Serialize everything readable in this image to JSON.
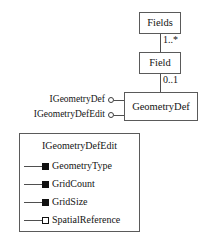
{
  "diagram": {
    "kind": "uml-class-diagram",
    "colors": {
      "background": "#ffffff",
      "box_border": "#5a5a5a",
      "line": "#4f4f4f",
      "text": "#141414",
      "marker_fill": "#111111"
    }
  },
  "classes": {
    "fields": {
      "name": "Fields"
    },
    "field": {
      "name": "Field"
    },
    "geometry_def": {
      "name": "GeometryDef"
    }
  },
  "associations": [
    {
      "from": "Fields",
      "to": "Field",
      "multiplicity": "1..*"
    },
    {
      "from": "Field",
      "to": "GeometryDef",
      "multiplicity": "0..1"
    }
  ],
  "multiplicities": {
    "fields_to_field": "1..*",
    "field_to_geometrydef": "0..1"
  },
  "interfaces": [
    {
      "name": "IGeometryDef"
    },
    {
      "name": "IGeometryDefEdit"
    }
  ],
  "interface_panel": {
    "title": "IGeometryDefEdit",
    "members": [
      {
        "label": "GeometryType",
        "marker": "filled"
      },
      {
        "label": "GridCount",
        "marker": "filled"
      },
      {
        "label": "GridSize",
        "marker": "filled"
      },
      {
        "label": "SpatialReference",
        "marker": "hollow"
      }
    ]
  }
}
